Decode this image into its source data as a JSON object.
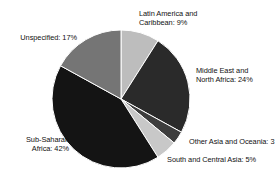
{
  "chart_data": {
    "type": "pie",
    "title": "",
    "subtitle": "",
    "xlabel": "",
    "ylabel": "",
    "legend_position": "none",
    "grid": false,
    "start_angle_deg": 0,
    "direction": "clockwise",
    "unit": "%",
    "categories": [
      "Latin America and Caribbean",
      "Middle East and North Africa",
      "Other Asia and Oceania",
      "South and Central Asia",
      "Sub-Saharan Africa",
      "Unspecified"
    ],
    "values": [
      9,
      24,
      3,
      5,
      42,
      17
    ],
    "colors": [
      "#bdbdbd",
      "#2a2a2a",
      "#3d3d3d",
      "#c8c8c8",
      "#141414",
      "#757575"
    ],
    "slices": [
      {
        "name": "Latin America and Caribbean",
        "value": 9,
        "color": "#bdbdbd",
        "label_line1": "Latin America and",
        "label_line2": "Caribbean: 9%"
      },
      {
        "name": "Middle East and North Africa",
        "value": 24,
        "color": "#2a2a2a",
        "label_line1": "Middle East and",
        "label_line2": "North Africa: 24%"
      },
      {
        "name": "Other Asia and Oceania",
        "value": 3,
        "color": "#3d3d3d",
        "label_line1": "Other Asia and Oceania: 3",
        "label_line2": ""
      },
      {
        "name": "South and Central Asia",
        "value": 5,
        "color": "#c8c8c8",
        "label_line1": "South and Central Asia: 5%",
        "label_line2": ""
      },
      {
        "name": "Sub-Saharan Africa",
        "value": 42,
        "color": "#141414",
        "label_line1": "Sub-Saharan",
        "label_line2": "Africa: 42%"
      },
      {
        "name": "Unspecified",
        "value": 17,
        "color": "#757575",
        "label_line1": "Unspecified: 17%",
        "label_line2": ""
      }
    ]
  },
  "labels": {
    "latin_line1": "Latin America and",
    "latin_line2": "Caribbean: 9%",
    "mena_line1": "Middle East and",
    "mena_line2": "North Africa: 24%",
    "other_asia": "Other Asia and Oceania: 3",
    "south_asia": "South and Central Asia: 5%",
    "subsaharan_line1": "Sub-Saharan",
    "subsaharan_line2": "Africa: 42%",
    "unspecified": "Unspecified: 17%"
  }
}
